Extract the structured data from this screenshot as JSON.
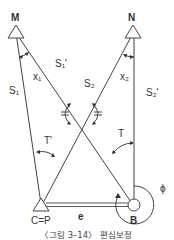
{
  "diagram": {
    "points": {
      "M": "M",
      "N": "N",
      "C": "C=P",
      "B": "B"
    },
    "sides": {
      "s1": "S₁",
      "s1_prime": "S₁'",
      "s2": "S₂",
      "s2_prime": "S₂'",
      "e": "e"
    },
    "angles": {
      "x1": "x₁",
      "x2": "x₂",
      "t": "T",
      "t_prime": "T'",
      "phi": "ϕ"
    },
    "caption": "〈그림 3–14〉 편심보정"
  }
}
